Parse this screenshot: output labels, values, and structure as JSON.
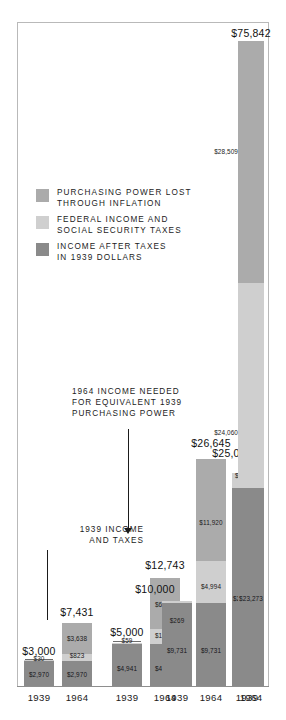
{
  "chart_data": {
    "type": "bar",
    "subtype": "stacked-bar-grouped",
    "title": "",
    "xlabel": "",
    "ylabel": "",
    "ylim": [
      0,
      75842
    ],
    "grid": false,
    "legend_position": "upper-left-inside",
    "categories": [
      "1939",
      "1964",
      "1939",
      "1964",
      "1939",
      "1964",
      "1939",
      "1964"
    ],
    "groups": [
      {
        "group_index": 1,
        "bars": [
          "1939",
          "1964"
        ]
      },
      {
        "group_index": 2,
        "bars": [
          "1939",
          "1964"
        ]
      },
      {
        "group_index": 3,
        "bars": [
          "1939",
          "1964"
        ]
      },
      {
        "group_index": 4,
        "bars": [
          "1939",
          "1964"
        ]
      }
    ],
    "series": [
      {
        "name": "INCOME AFTER TAXES IN 1939 DOLLARS",
        "color": "#8a8a8a",
        "values": [
          2970,
          2970,
          4941,
          4941,
          9731,
          9731,
          23273,
          23273
        ]
      },
      {
        "name": "FEDERAL INCOME AND SOCIAL SECURITY TAXES",
        "color": "#cfcfcf",
        "values": [
          30,
          823,
          59,
          1749,
          269,
          4994,
          1727,
          24060
        ]
      },
      {
        "name": "PURCHASING POWER LOST THROUGH INFLATION",
        "color": "#ababab",
        "values": [
          0,
          3638,
          0,
          6053,
          0,
          11920,
          0,
          28509
        ]
      }
    ],
    "totals": [
      3000,
      7431,
      5000,
      12743,
      10000,
      26645,
      25000,
      75842
    ],
    "total_labels": [
      "$3,000",
      "$7,431",
      "$5,000",
      "$12,743",
      "$10,000",
      "$26,645",
      "$25,000",
      "$75,842"
    ],
    "segment_labels": {
      "dark": [
        "$2,970",
        "$2,970",
        "$4,941",
        "$4,941",
        "$9,731",
        "$9,731",
        "$23,273",
        "$23,273"
      ],
      "tax": [
        "$30",
        "$823",
        "$59",
        "$1,749",
        "$269",
        "$4,994",
        "$1,727",
        "$24,060"
      ],
      "inflation": [
        "",
        "$3,638",
        "",
        "$6,053",
        "",
        "$11,920",
        "",
        "$28,509"
      ]
    },
    "annotations": [
      {
        "id": "needed",
        "text": "1964 INCOME NEEDED\nFOR EQUIVALENT 1939\nPURCHASING POWER"
      },
      {
        "id": "income-taxes",
        "text": "1939 INCOME\nAND TAXES"
      }
    ]
  },
  "legend": {
    "items": [
      {
        "label": "PURCHASING POWER LOST\nTHROUGH INFLATION",
        "color": "#ababab"
      },
      {
        "label": "FEDERAL INCOME AND\nSOCIAL SECURITY TAXES",
        "color": "#cfcfcf"
      },
      {
        "label": "INCOME AFTER TAXES\nIN 1939 DOLLARS",
        "color": "#8a8a8a"
      }
    ]
  },
  "axis": {
    "ticks": [
      "1939",
      "1964",
      "1939",
      "1964",
      "1939",
      "1964",
      "1939",
      "1964"
    ]
  },
  "colors": {
    "inflation": "#ababab",
    "taxes": "#cfcfcf",
    "income": "#8a8a8a",
    "frame": "#b9b9b9",
    "text": "#1b1b1b",
    "background": "#ffffff"
  }
}
